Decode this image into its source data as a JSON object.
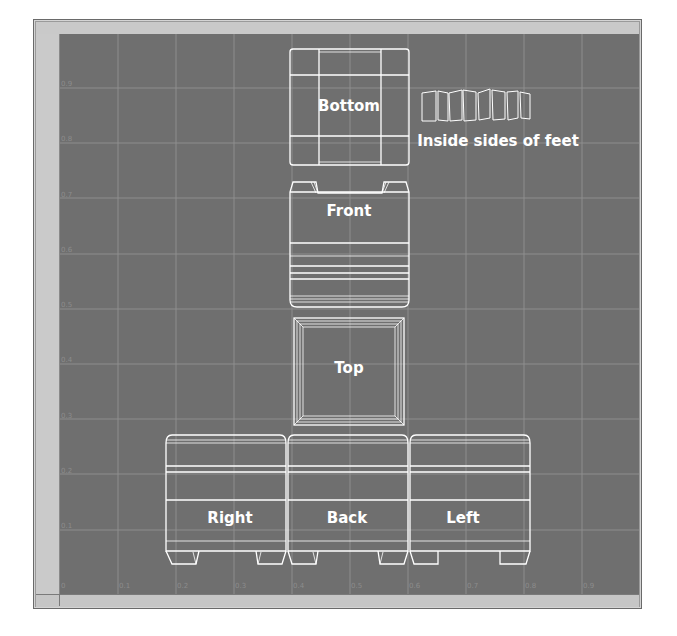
{
  "editor": {
    "view": "UV Texture Editor",
    "background_color": "#6f6f6f",
    "grid_color": "#8e8e8e",
    "wire_color": "#ffffff"
  },
  "axes": {
    "x_ticks": [
      "0",
      "0.1",
      "0.2",
      "0.3",
      "0.4",
      "0.5",
      "0.6",
      "0.7",
      "0.8",
      "0.9"
    ],
    "y_ticks": [
      "0.1",
      "0.2",
      "0.3",
      "0.4",
      "0.5",
      "0.6",
      "0.7",
      "0.8",
      "0.9"
    ]
  },
  "uv_shells": {
    "bottom": "Bottom",
    "inside_feet": "Inside sides of feet",
    "front": "Front",
    "top": "Top",
    "right": "Right",
    "back": "Back",
    "left": "Left"
  }
}
